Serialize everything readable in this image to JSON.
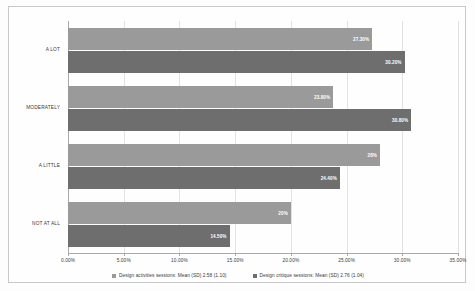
{
  "chart_data": {
    "type": "bar",
    "orientation": "horizontal",
    "title": "",
    "xlabel": "",
    "ylabel": "",
    "categories": [
      "A LOT",
      "MODERATELY",
      "A LITTLE",
      "NOT AT ALL"
    ],
    "series": [
      {
        "name": "Design activities sessions: Mean (SD) 2.58 (1.10)",
        "color": "#9a9a9a",
        "values": [
          27.3,
          23.8,
          28.0,
          20.0
        ],
        "labels": [
          "27.30%",
          "23.80%",
          "28%",
          "20%"
        ]
      },
      {
        "name": "Design critique sessions: Mean (SD) 2.76 (1.04)",
        "color": "#6e6e6e",
        "values": [
          30.2,
          30.8,
          24.4,
          14.5
        ],
        "labels": [
          "30.20%",
          "30.80%",
          "24.40%",
          "14.50%"
        ]
      }
    ],
    "xlim": [
      0,
      35
    ],
    "xticks": [
      0,
      5,
      10,
      15,
      20,
      25,
      30,
      35
    ],
    "xticklabels": [
      "0.00%",
      "5.00%",
      "10.00%",
      "15.00%",
      "20.00%",
      "25.00%",
      "30.00%",
      "35.00%"
    ],
    "grid": true,
    "legend_position": "bottom",
    "legend_marker": "square"
  }
}
